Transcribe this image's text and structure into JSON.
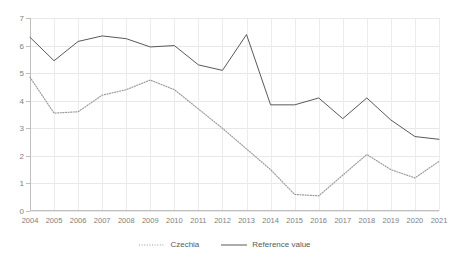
{
  "chart_data": {
    "type": "line",
    "title": "",
    "subtitle": "",
    "xlabel": "",
    "ylabel": "",
    "categories": [
      "2004",
      "2005",
      "2006",
      "2007",
      "2008",
      "2009",
      "2010",
      "2011",
      "2012",
      "2013",
      "2014",
      "2015",
      "2016",
      "2017",
      "2018",
      "2019",
      "2020",
      "2021"
    ],
    "x": [
      2004,
      2005,
      2006,
      2007,
      2008,
      2009,
      2010,
      2011,
      2012,
      2013,
      2014,
      2015,
      2016,
      2017,
      2018,
      2019,
      2020,
      2021
    ],
    "series": [
      {
        "name": "Czechia",
        "style": "dotted",
        "color": "#808080",
        "values": [
          4.85,
          3.55,
          3.6,
          4.2,
          4.4,
          4.75,
          4.4,
          3.7,
          3.0,
          2.25,
          1.5,
          0.6,
          0.55,
          1.3,
          2.05,
          1.5,
          1.2,
          1.8
        ]
      },
      {
        "name": "Reference value",
        "style": "solid",
        "color": "#595959",
        "values": [
          6.3,
          5.45,
          6.15,
          6.35,
          6.25,
          5.95,
          6.0,
          5.3,
          5.1,
          6.4,
          3.85,
          3.85,
          4.1,
          3.35,
          4.1,
          3.3,
          2.7,
          2.6
        ]
      }
    ],
    "ylim": [
      0,
      7
    ],
    "yticks": [
      0,
      1,
      2,
      3,
      4,
      5,
      6,
      7
    ],
    "ytick_labels": [
      "0",
      "1",
      "2",
      "3",
      "4",
      "5",
      "6",
      "7"
    ],
    "xlim": [
      2004,
      2021
    ],
    "grid": true,
    "grid_axis": "both",
    "legend_position": "bottom",
    "legend": [
      "Czechia",
      "Reference value"
    ]
  },
  "legend": {
    "items": [
      {
        "label": "Czechia",
        "icon": "dotted-line-swatch"
      },
      {
        "label": "Reference value",
        "icon": "solid-line-swatch"
      }
    ]
  },
  "colors": {
    "background": "#ffffff",
    "grid": "#e8e8e8",
    "axis": "#bfbfbf",
    "tick_text": "#808080",
    "czechia_line": "#808080",
    "reference_line": "#595959"
  }
}
